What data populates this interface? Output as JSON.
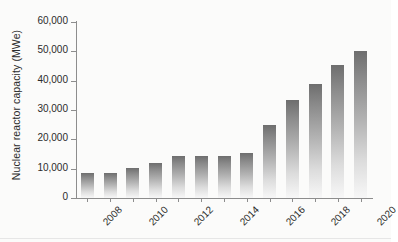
{
  "chart_data": {
    "type": "bar",
    "title": "",
    "xlabel": "",
    "ylabel": "Nuclear reactor capacity (MWe)",
    "categories": [
      "2008",
      "2009",
      "2010",
      "2011",
      "2012",
      "2013",
      "2014",
      "2015",
      "2016",
      "2017",
      "2018",
      "2019",
      "2020"
    ],
    "values": [
      8500,
      8400,
      10300,
      12000,
      14200,
      14200,
      14200,
      15300,
      25000,
      33500,
      39000,
      45500,
      50000
    ],
    "ylim": [
      0,
      60000
    ],
    "ytick_values": [
      0,
      10000,
      20000,
      30000,
      40000,
      50000,
      60000
    ],
    "ytick_labels": [
      "0",
      "10,000",
      "20,000",
      "30,000",
      "40,000",
      "50,000",
      "60,000"
    ],
    "xtick_labels_shown": [
      "2008",
      "2010",
      "2012",
      "2014",
      "2016",
      "2018",
      "2020"
    ],
    "xtick_label_rotation": -45,
    "grid": false,
    "legend": false,
    "legend_position": "none",
    "bar_fill": "vertical-gradient-gray",
    "bar_color_top": "#6e6e6e",
    "bar_color_bottom": "#f7f7f7",
    "axis_color": "#8d8d8d",
    "text_color": "#2b2b2b",
    "background": "#fbfbfa"
  }
}
